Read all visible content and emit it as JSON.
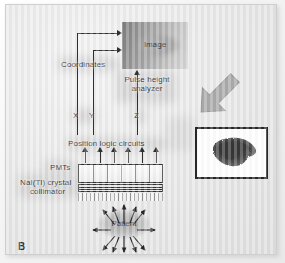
{
  "figure": {
    "panel_letter": "B",
    "title_alt": "Gamma camera (Anger camera) schematic"
  },
  "blocks": {
    "image": "Image",
    "coordinates": "Coordinates",
    "pulse_height_analyzer_line1": "Pulse height",
    "pulse_height_analyzer_line2": "analyzer",
    "position_logic": "Position logic circuits",
    "pmts": "PMTs",
    "crystal_line1": "NaI(Tl) crystal",
    "crystal_line2": "collimator",
    "patient": "Patient"
  },
  "signals": {
    "x": "X",
    "y": "Y",
    "z": "Z"
  },
  "colors": {
    "panel_background": "#e4e4e4",
    "line": "#1a1a1a",
    "image_box_dark": "#6f6f6f",
    "image_box_light": "#d2d2d2",
    "big_arrow": "#9b9b9b",
    "scan_border": "#111111",
    "liver": "#3a3a3a"
  },
  "counts": {
    "pmt_tubes": 6,
    "pmt_output_arrows": 6,
    "patient_rays": 12,
    "collimator_septa": 21
  }
}
